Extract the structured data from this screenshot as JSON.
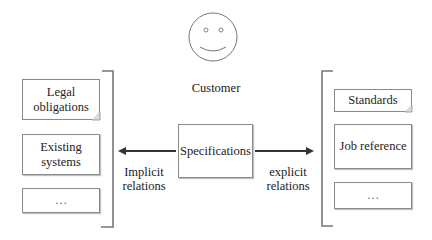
{
  "customer": {
    "label": "Customer",
    "icon": "smiley-face-icon"
  },
  "center": {
    "label": "Specifications"
  },
  "left_group": {
    "items": [
      {
        "label": "Legal obligations",
        "line1": "Legal",
        "line2": "obligations",
        "shape": "document"
      },
      {
        "label": "Existing systems",
        "line1": "Existing",
        "line2": "systems",
        "shape": "rectangle"
      },
      {
        "label": "…",
        "line1": "…",
        "line2": "",
        "shape": "rectangle"
      }
    ],
    "relation": {
      "line1": "Implicit",
      "line2": "relations",
      "direction": "left"
    }
  },
  "right_group": {
    "items": [
      {
        "label": "Standards",
        "line1": "Standards",
        "shape": "document"
      },
      {
        "label": "Job reference",
        "line1": "Job reference",
        "shape": "rectangle"
      },
      {
        "label": "…",
        "line1": "…",
        "shape": "rectangle"
      }
    ],
    "relation": {
      "line1": "explicit",
      "line2": "relations",
      "direction": "right"
    }
  },
  "colors": {
    "stroke": "#8a8a8a",
    "arrow": "#333333",
    "text": "#222222"
  }
}
